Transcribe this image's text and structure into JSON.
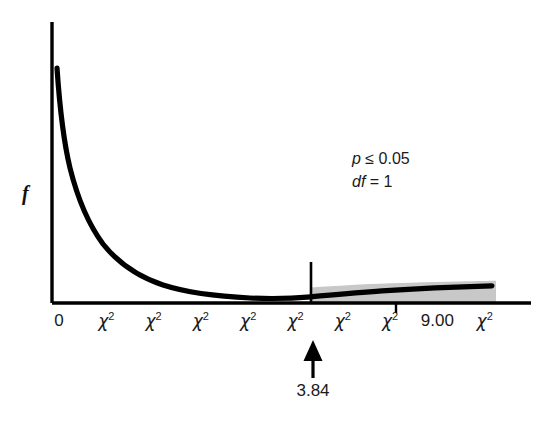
{
  "chart_data": {
    "type": "line",
    "title": "",
    "subtitle": "",
    "xlabel": "",
    "ylabel": "f",
    "distribution": "chi-square",
    "df": 1,
    "grid": false,
    "legend_position": "none",
    "xlim": [
      0,
      10.2
    ],
    "ylim": [
      0,
      1.0
    ],
    "x_tick_labels": [
      "0",
      "χ²",
      "χ²",
      "χ²",
      "χ²",
      "χ²",
      "χ²",
      "χ²",
      "9.00",
      "χ²"
    ],
    "x_tick_values": [
      0,
      1,
      2,
      3,
      4,
      5,
      6,
      7,
      9,
      10
    ],
    "y_tick_labels": [],
    "series": [
      {
        "name": "chi-square density (df = 1)",
        "x": [
          0.1,
          0.25,
          0.45,
          0.7,
          1.0,
          1.35,
          1.75,
          2.2,
          2.7,
          3.25,
          3.84,
          4.5,
          5.2,
          6.0,
          7.0,
          8.0,
          9.0,
          10.0
        ],
        "values": [
          0.855,
          0.64,
          0.48,
          0.36,
          0.27,
          0.2,
          0.148,
          0.108,
          0.08,
          0.058,
          0.043,
          0.032,
          0.024,
          0.017,
          0.011,
          0.008,
          0.005,
          0.004
        ]
      }
    ],
    "shaded_region": {
      "label": "critical region",
      "from": 3.84,
      "to": 10.2,
      "color": "#c8c8c8"
    },
    "annotations": [
      {
        "name": "significance-level",
        "text": "p ≤ 0.05"
      },
      {
        "name": "degrees-of-freedom",
        "text": "df = 1"
      },
      {
        "name": "critical-value",
        "text": "3.84"
      }
    ]
  },
  "axis": {
    "y_label": "f",
    "tick_labels": [
      {
        "text": "0",
        "is_chi": false
      },
      {
        "text": "χ",
        "is_chi": true
      },
      {
        "text": "χ",
        "is_chi": true
      },
      {
        "text": "χ",
        "is_chi": true
      },
      {
        "text": "χ",
        "is_chi": true
      },
      {
        "text": "χ",
        "is_chi": true
      },
      {
        "text": "χ",
        "is_chi": true
      },
      {
        "text": "χ",
        "is_chi": true
      },
      {
        "text": "9.00",
        "is_chi": false
      },
      {
        "text": "χ",
        "is_chi": true
      }
    ],
    "superscript": "2"
  },
  "annotations": {
    "p_value": "p ≤ 0.05",
    "p_italic_part": "p",
    "p_rest": " ≤ 0.05",
    "df_italic_part": "df",
    "df_rest": " = 1",
    "critical_value": "3.84"
  },
  "colors": {
    "curve": "#000000",
    "axis": "#000000",
    "shade": "#c8c8c8",
    "text": "#1a1a1a",
    "background": "#ffffff"
  }
}
